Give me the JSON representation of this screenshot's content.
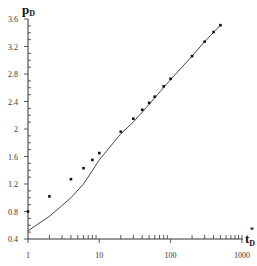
{
  "chart_data": {
    "type": "scatter",
    "title": "",
    "xlabel": "t_D*",
    "ylabel": "p_D",
    "xscale": "log",
    "xlim": [
      1,
      1000
    ],
    "ylim": [
      0.4,
      3.6
    ],
    "grid": false,
    "legend": null,
    "x_tick_labels": [
      "1",
      "10",
      "100",
      "1000"
    ],
    "y_tick_labels": [
      "0.4",
      "0.8",
      "1.2",
      "1.6",
      "2",
      "2.4",
      "2.8",
      "3.2",
      "3.6"
    ],
    "series": [
      {
        "name": "measured",
        "style": "points",
        "color": "#111111",
        "x": [
          1,
          2,
          4,
          6,
          8,
          10,
          20,
          30,
          40,
          50,
          60,
          80,
          100,
          200,
          300,
          400,
          500
        ],
        "y": [
          0.8,
          1.02,
          1.27,
          1.43,
          1.55,
          1.65,
          1.96,
          2.15,
          2.28,
          2.38,
          2.47,
          2.62,
          2.73,
          3.06,
          3.27,
          3.41,
          3.51
        ]
      },
      {
        "name": "model",
        "style": "line",
        "color": "#333333",
        "x": [
          1,
          2,
          4,
          6,
          10,
          20,
          30,
          50,
          100,
          200,
          300,
          500
        ],
        "y": [
          0.52,
          0.73,
          1.0,
          1.2,
          1.55,
          1.93,
          2.1,
          2.36,
          2.72,
          3.06,
          3.27,
          3.51
        ]
      }
    ]
  },
  "axes": {
    "y_title": "p",
    "y_title_sub": "D",
    "x_title": "t",
    "x_title_sub": "D",
    "x_title_sup": "*"
  }
}
